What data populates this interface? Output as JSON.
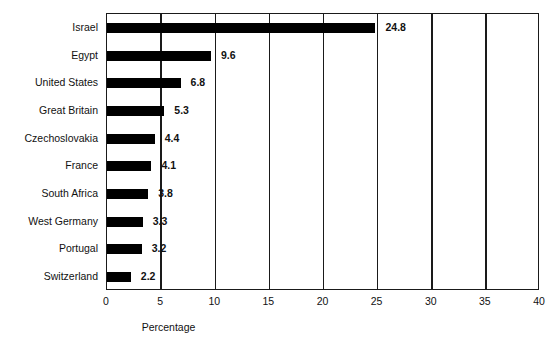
{
  "chart_data": {
    "type": "bar",
    "orientation": "horizontal",
    "title": "",
    "xlabel": "Percentage",
    "ylabel": "",
    "xlim": [
      0,
      40
    ],
    "xticks": [
      0,
      5,
      10,
      15,
      20,
      25,
      30,
      35,
      40
    ],
    "grid": true,
    "legend": null,
    "bar_color": "#000000",
    "axis_color": "#1a1a1a",
    "background": "#ffffff",
    "categories": [
      "Israel",
      "Egypt",
      "United States",
      "Great Britain",
      "Czechoslovakia",
      "France",
      "South Africa",
      "West Germany",
      "Portugal",
      "Switzerland"
    ],
    "values": [
      24.8,
      9.6,
      6.8,
      5.3,
      4.4,
      4.1,
      3.8,
      3.3,
      3.2,
      2.2
    ],
    "data_labels": [
      "24.8",
      "9.6",
      "6.8",
      "5.3",
      "4.4",
      "4.1",
      "3.8",
      "3.3",
      "3.2",
      "2.2"
    ]
  }
}
